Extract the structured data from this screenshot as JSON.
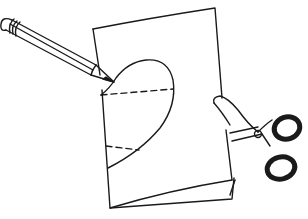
{
  "illustration": {
    "subject": "pencil-tracing-heart-on-folded-paper-with-scissors",
    "background_color": "#ffffff",
    "line_color": "#1a1a1a",
    "elements": [
      {
        "name": "pencil"
      },
      {
        "name": "folded-paper"
      },
      {
        "name": "half-heart-outline"
      },
      {
        "name": "dashed-fold-lines",
        "count": 2
      },
      {
        "name": "scissors"
      }
    ]
  }
}
